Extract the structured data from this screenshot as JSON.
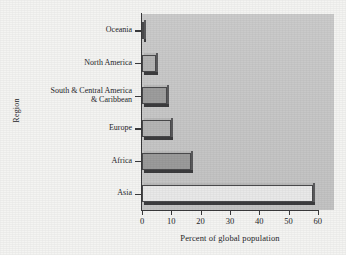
{
  "chart_data": {
    "type": "bar",
    "orientation": "horizontal",
    "title": "",
    "xlabel": "Percent of global population",
    "ylabel": "Region",
    "categories": [
      "Oceania",
      "North America",
      "South & Central America & Caribbean",
      "Europe",
      "Africa",
      "Asia"
    ],
    "category_labels_display": [
      [
        "Oceania"
      ],
      [
        "North America"
      ],
      [
        "South & Central America",
        "& Caribbean"
      ],
      [
        "Europe"
      ],
      [
        "Africa"
      ],
      [
        "Asia"
      ]
    ],
    "values": [
      0.5,
      4.8,
      8.5,
      10.0,
      16.7,
      58.5
    ],
    "xlim": [
      0,
      65
    ],
    "ylim": [
      0,
      6
    ],
    "xticks": [
      0,
      10,
      20,
      30,
      40,
      50,
      60
    ],
    "xtick_labels": [
      "0",
      "10",
      "20",
      "30",
      "40",
      "50",
      "60"
    ],
    "grid": false,
    "legend": null,
    "bar_colors": [
      "#c0c0c0",
      "#b4b4b4",
      "#9d9d9d",
      "#b5b5b5",
      "#9b9b9b",
      "#e9e9e9"
    ],
    "plot_background": "#c9c9c9",
    "figure_background": "#f4f4f2",
    "axis_color": "#3a3a3c"
  }
}
